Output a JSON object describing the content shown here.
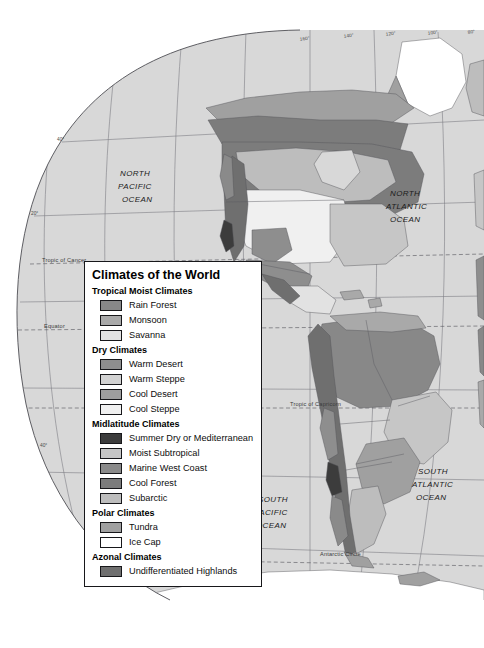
{
  "document": {
    "kind": "thematic-world-map",
    "projection_hint": "oval / pseudocylindrical world projection, western hemisphere visible"
  },
  "legend": {
    "title": "Climates of the World",
    "groups": [
      {
        "heading": "Tropical Moist Climates",
        "items": [
          {
            "label": "Rain Forest",
            "color": "#888888"
          },
          {
            "label": "Monsoon",
            "color": "#a9a9a9"
          },
          {
            "label": "Savanna",
            "color": "#e2e2e2"
          }
        ]
      },
      {
        "heading": "Dry Climates",
        "items": [
          {
            "label": "Warm Desert",
            "color": "#8e8e8e"
          },
          {
            "label": "Warm Steppe",
            "color": "#d2d2d2"
          },
          {
            "label": "Cool Desert",
            "color": "#9e9e9e"
          },
          {
            "label": "Cool Steppe",
            "color": "#f0f0f0"
          }
        ]
      },
      {
        "heading": "Midlatitude Climates",
        "items": [
          {
            "label": "Summer Dry or Mediterranean",
            "color": "#3c3c3c"
          },
          {
            "label": "Moist Subtropical",
            "color": "#c6c6c6"
          },
          {
            "label": "Marine West Coast",
            "color": "#8a8a8a"
          },
          {
            "label": "Cool Forest",
            "color": "#7c7c7c"
          },
          {
            "label": "Subarctic",
            "color": "#bdbdbd"
          }
        ]
      },
      {
        "heading": "Polar Climates",
        "items": [
          {
            "label": "Tundra",
            "color": "#a0a0a0"
          },
          {
            "label": "Ice Cap",
            "color": "#ffffff"
          }
        ]
      },
      {
        "heading": "Azonal Climates",
        "items": [
          {
            "label": "Undifferentiated Highlands",
            "color": "#6f6f6f"
          }
        ]
      }
    ]
  },
  "map": {
    "ocean_labels": [
      {
        "lines": [
          "NORTH",
          "PACIFIC",
          "OCEAN"
        ]
      },
      {
        "lines": [
          "NORTH",
          "ATLANTIC",
          "OCEAN"
        ]
      },
      {
        "lines": [
          "SOUTH",
          "PACIFIC",
          "OCEAN"
        ]
      },
      {
        "lines": [
          "SOUTH",
          "ATLANTIC",
          "OCEAN"
        ]
      }
    ],
    "ocean_label_text": {
      "north_pacific_1": "NORTH",
      "north_pacific_2": "PACIFIC",
      "north_pacific_3": "OCEAN",
      "north_atlantic_1": "NORTH",
      "north_atlantic_2": "ATLANTIC",
      "north_atlantic_3": "OCEAN",
      "south_pacific_1": "SOUTH",
      "south_pacific_2": "PACIFIC",
      "south_pacific_3": "OCEAN",
      "south_atlantic_1": "SOUTH",
      "south_atlantic_2": "ATLANTIC",
      "south_atlantic_3": "OCEAN"
    },
    "reference_lines": {
      "tropic_of_cancer": "Tropic of Cancer",
      "equator": "Equator",
      "tropic_of_capricorn": "Tropic of Capricorn",
      "antarctic_circle": "Antarctic Circle"
    },
    "longitude_labels": [
      "160°",
      "140°",
      "120°",
      "100°",
      "80°"
    ],
    "latitude_labels": [
      "40°",
      "20°",
      "40°"
    ],
    "ocean_fill": "#d8d8d8",
    "land_base_fill": "#cfcfcf"
  }
}
